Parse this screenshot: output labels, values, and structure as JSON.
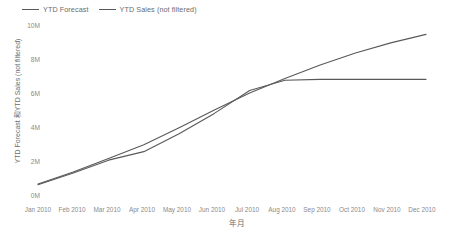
{
  "chart_data": {
    "type": "line",
    "title": "",
    "xlabel": "年月",
    "ylabel": "YTD Forecast 和YTD Sales (not filtered)",
    "categories": [
      "Jan 2010",
      "Feb 2010",
      "Mar 2010",
      "Apr 2010",
      "May 2010",
      "Jun 2010",
      "Jul 2010",
      "Aug 2010",
      "Sep 2010",
      "Oct 2010",
      "Nov 2010",
      "Dec 2010"
    ],
    "ytick_labels": [
      "0M",
      "2M",
      "4M",
      "6M",
      "8M",
      "10M"
    ],
    "ytick_values": [
      0,
      2000000,
      4000000,
      6000000,
      8000000,
      10000000
    ],
    "ylim": [
      0,
      10000000
    ],
    "grid": false,
    "legend_position": "top-left",
    "series": [
      {
        "name": "YTD Forecast",
        "color": "#595959",
        "values": [
          650000,
          1350000,
          2150000,
          2950000,
          3950000,
          5000000,
          6000000,
          6850000,
          7650000,
          8350000,
          8950000,
          9450000
        ]
      },
      {
        "name": "YTD Sales (not filtered)",
        "color": "#595959",
        "values": [
          600000,
          1300000,
          2050000,
          2550000,
          3600000,
          4800000,
          6150000,
          6750000,
          6800000,
          6800000,
          6800000,
          6800000
        ]
      }
    ]
  },
  "legend": {
    "items": [
      {
        "label": "YTD Forecast"
      },
      {
        "label": "YTD Sales (not filtered)"
      }
    ]
  }
}
